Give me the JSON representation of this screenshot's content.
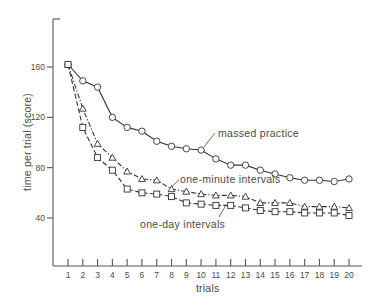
{
  "chart_data": {
    "type": "line",
    "title": "",
    "xlabel": "trials",
    "ylabel": "time per trial (score)",
    "x": [
      1,
      2,
      3,
      4,
      5,
      6,
      7,
      8,
      9,
      10,
      11,
      12,
      13,
      14,
      15,
      16,
      17,
      18,
      19,
      20
    ],
    "xticks": [
      "1",
      "2",
      "3",
      "4",
      "5",
      "6",
      "7",
      "8",
      "9",
      "10",
      "11",
      "12",
      "13",
      "14",
      "15",
      "16",
      "17",
      "18",
      "19",
      "20"
    ],
    "yticks": [
      40,
      80,
      120,
      160
    ],
    "ylim": [
      0,
      197
    ],
    "xlim": [
      0,
      21
    ],
    "grid": false,
    "legend": "inline annotations",
    "series": [
      {
        "name": "massed practice",
        "marker": "circle",
        "line_style": "solid",
        "values": [
          162,
          149,
          144,
          120,
          112,
          109,
          101,
          97,
          95,
          94,
          87,
          82,
          82,
          78,
          75,
          72,
          70,
          70,
          69,
          71
        ]
      },
      {
        "name": "one-minute intervals",
        "marker": "triangle",
        "line_style": "dash-dot",
        "values": [
          162,
          127,
          99,
          88,
          77,
          71,
          70,
          63,
          61,
          59,
          58,
          58,
          57,
          52,
          52,
          52,
          49,
          49,
          49,
          48
        ]
      },
      {
        "name": "one-day intervals",
        "marker": "square",
        "line_style": "dashed",
        "values": [
          162,
          112,
          88,
          78,
          63,
          60,
          59,
          57,
          52,
          51,
          50,
          50,
          48,
          46,
          45,
          45,
          44,
          44,
          44,
          42
        ]
      }
    ],
    "annotations": [
      {
        "text": "massed practice",
        "series": "massed practice"
      },
      {
        "text": "one-minute intervals",
        "series": "one-minute intervals"
      },
      {
        "text": "one-day intervals",
        "series": "one-day intervals"
      }
    ]
  },
  "labels": {
    "xlabel": "trials",
    "ylabel": "time per trial (score)",
    "annot_massed": "massed practice",
    "annot_minute": "one-minute intervals",
    "annot_day": "one-day intervals"
  },
  "colors": {
    "ink": "#333333",
    "text": "#4a4a4a",
    "background": "#ffffff"
  }
}
